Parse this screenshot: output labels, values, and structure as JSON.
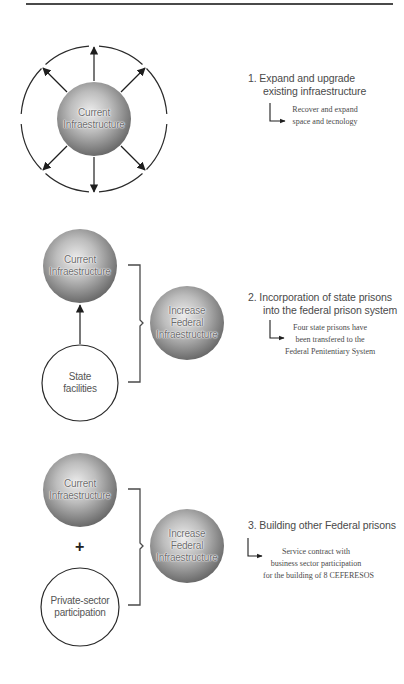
{
  "colors": {
    "line": "#2a2a2a",
    "sphere_light": "#e6e6e6",
    "sphere_dark": "#6e6e6e",
    "text": "#4a4a4a"
  },
  "section1": {
    "center_node": {
      "line1": "Current",
      "line2": "Infraestructure"
    },
    "arrows": 8,
    "step": {
      "title_line1": "1. Expand and upgrade",
      "title_line2": "existing infraestructure",
      "sub": [
        "Recover and expand",
        "space and tecnology"
      ]
    }
  },
  "section2": {
    "top_node": {
      "line1": "Current",
      "line2": "Infraestructure"
    },
    "bottom_node": {
      "line1": "State",
      "line2": "facilities"
    },
    "result_node": {
      "line1": "Increase",
      "line2": "Federal",
      "line3": "Infraestructure"
    },
    "step": {
      "title_line1": "2. Incorporation of state prisons",
      "title_line2": "into the federal prison system",
      "sub": [
        "Four state prisons have",
        "been transfered to the",
        "Federal Penitentiary System"
      ]
    }
  },
  "section3": {
    "top_node": {
      "line1": "Current",
      "line2": "Infraestructure"
    },
    "operator": "+",
    "bottom_node": {
      "line1": "Private-sector",
      "line2": "participation"
    },
    "result_node": {
      "line1": "Increase",
      "line2": "Federal",
      "line3": "Infraestructure"
    },
    "step": {
      "title_line1": "3. Building other Federal prisons",
      "sub": [
        "Service contract with",
        "business sector participation",
        "for the building of 8 CEFERESOS"
      ]
    }
  }
}
